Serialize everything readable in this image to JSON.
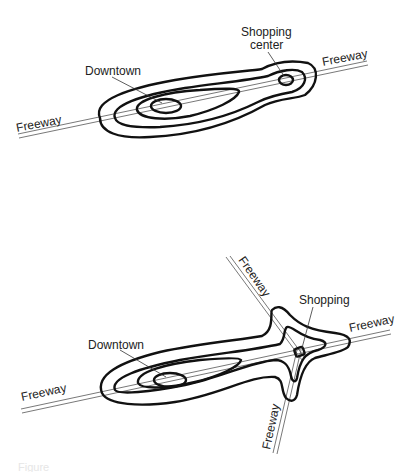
{
  "figures": [
    {
      "id": "top",
      "labels": {
        "freeway_left": "Freeway",
        "freeway_right": "Freeway",
        "downtown": "Downtown",
        "shopping_line1": "Shopping",
        "shopping_line2": "center"
      }
    },
    {
      "id": "bottom",
      "labels": {
        "freeway_left": "Freeway",
        "freeway_right": "Freeway",
        "freeway_top": "Freeway",
        "freeway_bottom": "Freeway",
        "downtown": "Downtown",
        "shopping": "Shopping"
      }
    }
  ],
  "caption": "Figure"
}
